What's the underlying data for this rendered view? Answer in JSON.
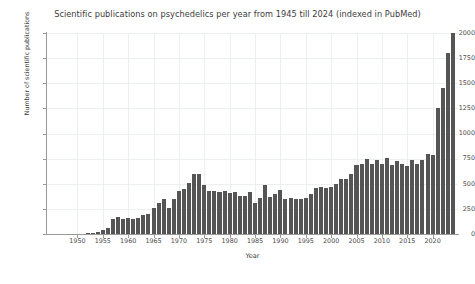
{
  "chart_data": {
    "type": "bar",
    "title": "Scientific publications on psychedelics per year from 1945 till 2024 (indexed in PubMed)",
    "xlabel": "Year",
    "ylabel": "Number of scientific publications",
    "grid": true,
    "legend": null,
    "xlim": [
      1944,
      2025
    ],
    "ylim": [
      0,
      2000
    ],
    "yticks": [
      0,
      250,
      500,
      750,
      1000,
      1250,
      1500,
      1750,
      2000
    ],
    "xticks": [
      1950,
      1955,
      1960,
      1965,
      1970,
      1975,
      1980,
      1985,
      1990,
      1995,
      2000,
      2005,
      2010,
      2015,
      2020
    ],
    "bar_color": "#555555",
    "grid_color": "#eceff2",
    "axis_color": "#9a9a9a",
    "categories": [
      1945,
      1946,
      1947,
      1948,
      1949,
      1950,
      1951,
      1952,
      1953,
      1954,
      1955,
      1956,
      1957,
      1958,
      1959,
      1960,
      1961,
      1962,
      1963,
      1964,
      1965,
      1966,
      1967,
      1968,
      1969,
      1970,
      1971,
      1972,
      1973,
      1974,
      1975,
      1976,
      1977,
      1978,
      1979,
      1980,
      1981,
      1982,
      1983,
      1984,
      1985,
      1986,
      1987,
      1988,
      1989,
      1990,
      1991,
      1992,
      1993,
      1994,
      1995,
      1996,
      1997,
      1998,
      1999,
      2000,
      2001,
      2002,
      2003,
      2004,
      2005,
      2006,
      2007,
      2008,
      2009,
      2010,
      2011,
      2012,
      2013,
      2014,
      2015,
      2016,
      2017,
      2018,
      2019,
      2020,
      2021,
      2022,
      2023,
      2024
    ],
    "values": [
      0,
      0,
      0,
      0,
      0,
      2,
      4,
      6,
      10,
      20,
      35,
      60,
      150,
      165,
      150,
      160,
      150,
      160,
      185,
      200,
      260,
      310,
      350,
      255,
      345,
      430,
      445,
      505,
      600,
      600,
      490,
      425,
      425,
      415,
      425,
      410,
      420,
      380,
      375,
      420,
      310,
      355,
      490,
      365,
      395,
      435,
      345,
      360,
      345,
      350,
      360,
      395,
      460,
      465,
      455,
      470,
      500,
      545,
      545,
      595,
      685,
      700,
      745,
      700,
      740,
      700,
      760,
      690,
      730,
      700,
      675,
      740,
      700,
      740,
      800,
      790,
      1250,
      1450,
      1800,
      2000
    ]
  }
}
